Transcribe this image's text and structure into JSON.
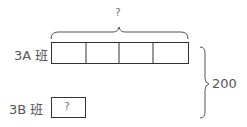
{
  "diagram": {
    "type": "bar-model",
    "top_total_label": "?",
    "rows": [
      {
        "label": "3A 班",
        "segments": 4,
        "segment_label": ""
      },
      {
        "label": "3B 班",
        "segments": 1,
        "segment_label": "?"
      }
    ],
    "grand_total_label": "200",
    "colors": {
      "line": "#333333",
      "text": "#555555"
    }
  }
}
